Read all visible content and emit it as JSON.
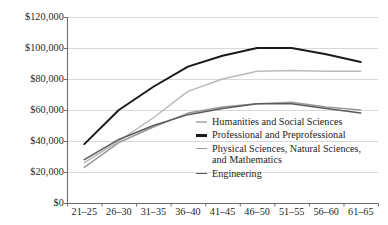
{
  "chart_data": {
    "type": "line",
    "title": "",
    "subtitle": "",
    "xlabel": "",
    "ylabel": "",
    "categories": [
      "21–25",
      "26–30",
      "31–35",
      "36–40",
      "41–45",
      "46–50",
      "51–55",
      "56–60",
      "61–65"
    ],
    "ylim": [
      0,
      120000
    ],
    "ytick_values": [
      0,
      20000,
      40000,
      60000,
      80000,
      100000,
      120000
    ],
    "ytick_labels": [
      "$0",
      "$20,000",
      "$40,000",
      "$60,000",
      "$80,000",
      "$100,000",
      "$120,000"
    ],
    "grid": "horizontal",
    "legend_position": "inside-lower-right",
    "series": [
      {
        "name": "Humanities and Social Sciences",
        "color": "#b9b9b9",
        "width": 1.5,
        "values": [
          26000,
          40000,
          55000,
          72000,
          80000,
          85000,
          85500,
          85000,
          85000
        ]
      },
      {
        "name": "Professional and Preprofessional",
        "color": "#1a1a1a",
        "width": 2.0,
        "values": [
          38000,
          60000,
          75000,
          88000,
          95000,
          100000,
          100000,
          96000,
          91000
        ]
      },
      {
        "name": "Physical Sciences, Natural Sciences,\nand Mathematics",
        "color": "#9a9a9a",
        "width": 1.5,
        "values": [
          23000,
          39000,
          49000,
          58000,
          62000,
          64000,
          65000,
          62000,
          60000
        ]
      },
      {
        "name": "Engineering",
        "color": "#5c5c5c",
        "width": 1.5,
        "values": [
          28000,
          41000,
          50000,
          57000,
          61000,
          64000,
          64000,
          61000,
          58000
        ]
      }
    ]
  },
  "legend": {
    "items": [
      {
        "label": "Humanities and Social Sciences",
        "color": "#b9b9b9",
        "thickness": "1.6px"
      },
      {
        "label": "Professional and Preprofessional",
        "color": "#1a1a1a",
        "thickness": "2.2px"
      },
      {
        "label": "Physical Sciences, Natural Sciences,\nand Mathematics",
        "color": "#9a9a9a",
        "thickness": "1.6px"
      },
      {
        "label": "Engineering",
        "color": "#5c5c5c",
        "thickness": "1.6px"
      }
    ]
  },
  "axes": {
    "axis_color": "#6e6e6e",
    "grid_color": "#d8d8d8"
  }
}
